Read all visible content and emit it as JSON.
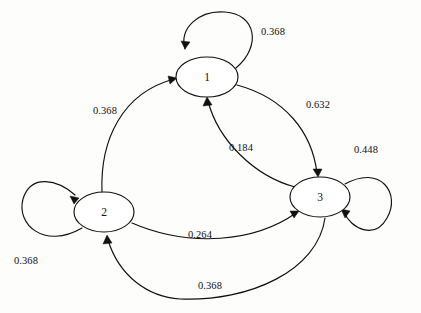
{
  "diagram": {
    "type": "state-transition-diagram",
    "title": "",
    "background_color": "#fdfdfc",
    "stroke_color": "#111111",
    "node_fill": "#ffffff",
    "nodes": [
      {
        "id": "1",
        "label": "1",
        "cx": 207,
        "cy": 77,
        "rx": 31,
        "ry": 20
      },
      {
        "id": "2",
        "label": "2",
        "cx": 104,
        "cy": 212,
        "rx": 30,
        "ry": 20
      },
      {
        "id": "3",
        "label": "3",
        "cx": 320,
        "cy": 197,
        "rx": 30,
        "ry": 20
      }
    ],
    "edges": [
      {
        "id": "e-1-1",
        "from": "1",
        "to": "1",
        "weight": "0.368",
        "kind": "self-loop",
        "label_x": 273,
        "label_y": 33
      },
      {
        "id": "e-2-1",
        "from": "2",
        "to": "1",
        "weight": "0.368",
        "kind": "arc",
        "label_x": 105,
        "label_y": 112
      },
      {
        "id": "e-1-3",
        "from": "1",
        "to": "3",
        "weight": "0.632",
        "kind": "arc",
        "label_x": 318,
        "label_y": 106
      },
      {
        "id": "e-3-1",
        "from": "3",
        "to": "1",
        "weight": "0.184",
        "kind": "arc",
        "label_x": 241,
        "label_y": 149
      },
      {
        "id": "e-3-3",
        "from": "3",
        "to": "3",
        "weight": "0.448",
        "kind": "self-loop",
        "label_x": 366,
        "label_y": 151
      },
      {
        "id": "e-2-2",
        "from": "2",
        "to": "2",
        "weight": "0.368",
        "kind": "self-loop",
        "label_x": 26,
        "label_y": 262
      },
      {
        "id": "e-2-3",
        "from": "2",
        "to": "3",
        "weight": "0.264",
        "kind": "arc",
        "label_x": 200,
        "label_y": 236
      },
      {
        "id": "e-3-2",
        "from": "3",
        "to": "2",
        "weight": "0.368",
        "kind": "arc",
        "label_x": 210,
        "label_y": 287
      }
    ]
  }
}
